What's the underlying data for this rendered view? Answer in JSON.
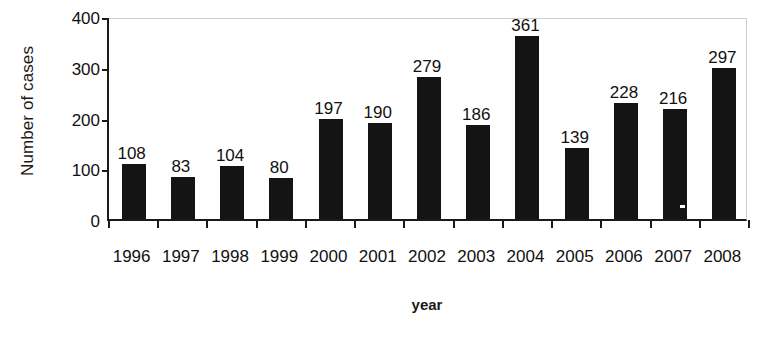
{
  "chart_data": {
    "type": "bar",
    "title": "",
    "xlabel": "year",
    "ylabel": "Number of cases",
    "categories": [
      "1996",
      "1997",
      "1998",
      "1999",
      "2000",
      "2001",
      "2002",
      "2003",
      "2004",
      "2005",
      "2006",
      "2007",
      "2008"
    ],
    "values": [
      108,
      83,
      104,
      80,
      197,
      190,
      279,
      186,
      361,
      139,
      228,
      216,
      297
    ],
    "value_labels": [
      "108",
      "83",
      "104",
      "80",
      "197",
      "190",
      "279",
      "186",
      "361",
      "139",
      "228",
      "216",
      "297"
    ],
    "ylim": [
      0,
      400
    ],
    "yticks": [
      0,
      100,
      200,
      300,
      400
    ],
    "ytick_labels": [
      "0",
      "100",
      "200",
      "300",
      "400"
    ],
    "grid": false,
    "legend": false,
    "legend_position": "none",
    "bar_color": "#141414",
    "axis_color": "#1a1a1a",
    "frame_color": "#cfcfcf",
    "background_color": "#ffffff",
    "annotations": [
      "small white speck artifact inside the 2007 bar near its lower right edge"
    ]
  }
}
